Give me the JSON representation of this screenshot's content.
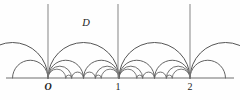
{
  "figure": {
    "caption": "",
    "background_color": "#fefefe",
    "stroke_color": "#4a4a4a",
    "axis_color": "#6e6e6e",
    "label_color": "#1d1d1d",
    "width": 240,
    "height": 100
  },
  "region": {
    "label": "D",
    "x": 86,
    "y": 26
  },
  "axis": {
    "name": "real-axis",
    "y": 78,
    "x_start": 6,
    "x_end": 234,
    "ticks": [
      {
        "label": "O",
        "value": 0,
        "x": 48,
        "italic": true
      },
      {
        "label": "1",
        "value": 1,
        "x": 118,
        "italic": false
      },
      {
        "label": "2",
        "value": 2,
        "x": 190,
        "italic": false
      }
    ]
  },
  "vertical_lines": [
    {
      "name": "vertical-geodesic-0",
      "x": 48,
      "y_top": 4,
      "y_bottom": 78
    },
    {
      "name": "vertical-geodesic-1",
      "x": 118,
      "y_top": 4,
      "y_bottom": 78
    },
    {
      "name": "vertical-geodesic-2",
      "x": 190,
      "y_top": 4,
      "y_bottom": 78
    }
  ],
  "geometry": {
    "unit_px": 71,
    "origin_px": 48,
    "baseline_px": 78,
    "levels": [
      {
        "level": 1,
        "description": "integer-to-integer arcs, radius 1 unit"
      },
      {
        "level": 2,
        "description": "arcs to halves, radius 1/2 unit"
      },
      {
        "level": 3,
        "description": "arcs to thirds, radius 1/3 and 1/6 unit"
      },
      {
        "level": 4,
        "description": "smallest arcs near the baseline"
      }
    ]
  },
  "arcs": {
    "level1": [
      {
        "a": -1,
        "b": 0
      },
      {
        "a": 0,
        "b": 1
      },
      {
        "a": 1,
        "b": 2
      },
      {
        "a": 2,
        "b": 3
      }
    ],
    "level2": [
      {
        "a": 0,
        "b": 0.5
      },
      {
        "a": 0.5,
        "b": 1
      },
      {
        "a": 1,
        "b": 1.5
      },
      {
        "a": 1.5,
        "b": 2
      },
      {
        "a": -0.5,
        "b": 0
      },
      {
        "a": 2,
        "b": 2.5
      }
    ],
    "level3": [
      {
        "a": 0,
        "b": 0.3333
      },
      {
        "a": 0.3333,
        "b": 0.5
      },
      {
        "a": 0.5,
        "b": 0.6667
      },
      {
        "a": 0.6667,
        "b": 1
      },
      {
        "a": 1,
        "b": 1.3333
      },
      {
        "a": 1.3333,
        "b": 1.5
      },
      {
        "a": 1.5,
        "b": 1.6667
      },
      {
        "a": 1.6667,
        "b": 2
      }
    ],
    "level4": [
      {
        "a": 0,
        "b": 0.25
      },
      {
        "a": 0.25,
        "b": 0.3333
      },
      {
        "a": 0.6667,
        "b": 0.75
      },
      {
        "a": 0.75,
        "b": 1
      },
      {
        "a": 1,
        "b": 1.25
      },
      {
        "a": 1.25,
        "b": 1.3333
      },
      {
        "a": 1.6667,
        "b": 1.75
      },
      {
        "a": 1.75,
        "b": 2
      }
    ]
  }
}
